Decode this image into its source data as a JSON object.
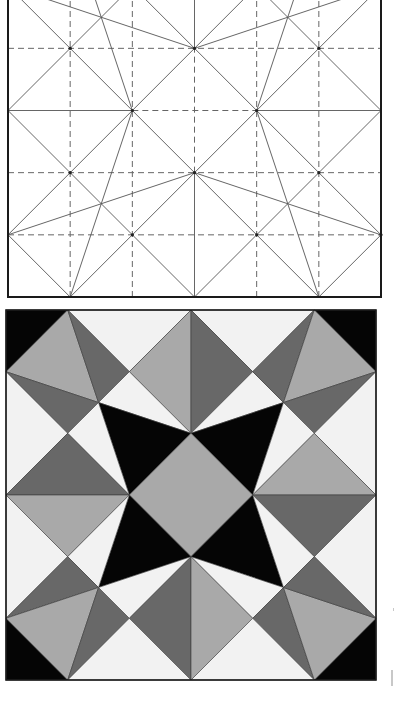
{
  "figure": {
    "grid_units": 6,
    "colors": {
      "paper": "#ffffff",
      "frame": "#1a1a1a",
      "crease_solid": "#555555",
      "crease_dashed": "#666666",
      "white": "#f2f2f2",
      "light_gray": "#a9a9a9",
      "dark_gray": "#686868",
      "black": "#050505"
    }
  },
  "crease_pattern": {
    "label": "crease pattern",
    "dashed_lines": [
      [
        1,
        0,
        1,
        6
      ],
      [
        2,
        0,
        2,
        6
      ],
      [
        4,
        0,
        4,
        6
      ],
      [
        5,
        0,
        5,
        6
      ],
      [
        3,
        2,
        3,
        4
      ],
      [
        0,
        1,
        6,
        1
      ],
      [
        0,
        2,
        6,
        2
      ],
      [
        0,
        4,
        6,
        4
      ],
      [
        0,
        5,
        6,
        5
      ],
      [
        2,
        3,
        4,
        3
      ]
    ],
    "solid_lines": [
      [
        3,
        0,
        3,
        2
      ],
      [
        3,
        4,
        3,
        6
      ],
      [
        0,
        3,
        2,
        3
      ],
      [
        4,
        3,
        6,
        3
      ],
      [
        0,
        1,
        1,
        0
      ],
      [
        1,
        0,
        2,
        1
      ],
      [
        2,
        1,
        3,
        0
      ],
      [
        3,
        0,
        4,
        1
      ],
      [
        4,
        1,
        5,
        0
      ],
      [
        5,
        0,
        6,
        1
      ],
      [
        0,
        1,
        1,
        2
      ],
      [
        1,
        2,
        2,
        1
      ],
      [
        2,
        1,
        3,
        2
      ],
      [
        3,
        2,
        4,
        1
      ],
      [
        4,
        1,
        5,
        2
      ],
      [
        5,
        2,
        6,
        1
      ],
      [
        0,
        3,
        1,
        2
      ],
      [
        1,
        2,
        2,
        3
      ],
      [
        2,
        3,
        3,
        2
      ],
      [
        3,
        2,
        4,
        3
      ],
      [
        4,
        3,
        5,
        2
      ],
      [
        5,
        2,
        6,
        3
      ],
      [
        0,
        3,
        1,
        4
      ],
      [
        1,
        4,
        2,
        3
      ],
      [
        2,
        3,
        3,
        4
      ],
      [
        3,
        4,
        4,
        3
      ],
      [
        4,
        3,
        5,
        4
      ],
      [
        5,
        4,
        6,
        3
      ],
      [
        0,
        5,
        1,
        4
      ],
      [
        1,
        4,
        2,
        5
      ],
      [
        2,
        5,
        3,
        4
      ],
      [
        3,
        4,
        4,
        5
      ],
      [
        4,
        5,
        5,
        4
      ],
      [
        5,
        4,
        6,
        5
      ],
      [
        0,
        5,
        1,
        6
      ],
      [
        1,
        6,
        2,
        5
      ],
      [
        2,
        5,
        3,
        6
      ],
      [
        3,
        6,
        4,
        5
      ],
      [
        4,
        5,
        5,
        6
      ],
      [
        5,
        6,
        6,
        5
      ],
      [
        0,
        1,
        3,
        2
      ],
      [
        3,
        2,
        6,
        1
      ],
      [
        0,
        5,
        3,
        4
      ],
      [
        3,
        4,
        6,
        5
      ],
      [
        1,
        0,
        2,
        3
      ],
      [
        5,
        0,
        4,
        3
      ],
      [
        1,
        6,
        2,
        3
      ],
      [
        5,
        6,
        4,
        3
      ]
    ]
  },
  "folded_pattern": {
    "label": "folded result",
    "polygons": [
      {
        "c": "black",
        "p": [
          [
            0,
            0
          ],
          [
            1,
            0
          ],
          [
            0,
            1
          ]
        ]
      },
      {
        "c": "black",
        "p": [
          [
            5,
            0
          ],
          [
            6,
            0
          ],
          [
            6,
            1
          ]
        ]
      },
      {
        "c": "black",
        "p": [
          [
            0,
            5
          ],
          [
            0,
            6
          ],
          [
            1,
            6
          ]
        ]
      },
      {
        "c": "black",
        "p": [
          [
            6,
            5
          ],
          [
            6,
            6
          ],
          [
            5,
            6
          ]
        ]
      },
      {
        "c": "white",
        "p": [
          [
            1,
            0
          ],
          [
            3,
            0
          ],
          [
            2,
            1
          ]
        ]
      },
      {
        "c": "white",
        "p": [
          [
            3,
            0
          ],
          [
            5,
            0
          ],
          [
            4,
            1
          ]
        ]
      },
      {
        "c": "light_gray",
        "p": [
          [
            1,
            0
          ],
          [
            0,
            1
          ],
          [
            1.5,
            1.5
          ]
        ]
      },
      {
        "c": "dark_gray",
        "p": [
          [
            1,
            0
          ],
          [
            2,
            1
          ],
          [
            1.5,
            1.5
          ]
        ]
      },
      {
        "c": "dark_gray",
        "p": [
          [
            0,
            1
          ],
          [
            1.5,
            1.5
          ],
          [
            1,
            2
          ]
        ]
      },
      {
        "c": "light_gray",
        "p": [
          [
            2,
            1
          ],
          [
            3,
            0
          ],
          [
            3,
            2
          ]
        ]
      },
      {
        "c": "dark_gray",
        "p": [
          [
            3,
            0
          ],
          [
            4,
            1
          ],
          [
            3,
            2
          ]
        ]
      },
      {
        "c": "white",
        "p": [
          [
            2,
            1
          ],
          [
            1.5,
            1.5
          ],
          [
            3,
            2
          ]
        ]
      },
      {
        "c": "white",
        "p": [
          [
            4,
            1
          ],
          [
            4.5,
            1.5
          ],
          [
            3,
            2
          ]
        ]
      },
      {
        "c": "dark_gray",
        "p": [
          [
            5,
            0
          ],
          [
            4,
            1
          ],
          [
            4.5,
            1.5
          ]
        ]
      },
      {
        "c": "light_gray",
        "p": [
          [
            5,
            0
          ],
          [
            6,
            1
          ],
          [
            4.5,
            1.5
          ]
        ]
      },
      {
        "c": "dark_gray",
        "p": [
          [
            6,
            1
          ],
          [
            4.5,
            1.5
          ],
          [
            5,
            2
          ]
        ]
      },
      {
        "c": "white",
        "p": [
          [
            0,
            1
          ],
          [
            1,
            2
          ],
          [
            0,
            3
          ]
        ]
      },
      {
        "c": "white",
        "p": [
          [
            6,
            1
          ],
          [
            5,
            2
          ],
          [
            6,
            3
          ]
        ]
      },
      {
        "c": "black",
        "p": [
          [
            1.5,
            1.5
          ],
          [
            3,
            2
          ],
          [
            2,
            3
          ]
        ]
      },
      {
        "c": "black",
        "p": [
          [
            3,
            2
          ],
          [
            4.5,
            1.5
          ],
          [
            4,
            3
          ]
        ]
      },
      {
        "c": "white",
        "p": [
          [
            1.5,
            1.5
          ],
          [
            1,
            2
          ],
          [
            2,
            3
          ]
        ]
      },
      {
        "c": "white",
        "p": [
          [
            4.5,
            1.5
          ],
          [
            5,
            2
          ],
          [
            4,
            3
          ]
        ]
      },
      {
        "c": "light_gray",
        "p": [
          [
            3,
            2
          ],
          [
            4,
            3
          ],
          [
            3,
            4
          ],
          [
            2,
            3
          ]
        ]
      },
      {
        "c": "dark_gray",
        "p": [
          [
            1,
            2
          ],
          [
            2,
            3
          ],
          [
            0,
            3
          ]
        ]
      },
      {
        "c": "light_gray",
        "p": [
          [
            0,
            3
          ],
          [
            2,
            3
          ],
          [
            1,
            4
          ]
        ]
      },
      {
        "c": "light_gray",
        "p": [
          [
            5,
            2
          ],
          [
            6,
            3
          ],
          [
            4,
            3
          ]
        ]
      },
      {
        "c": "dark_gray",
        "p": [
          [
            4,
            3
          ],
          [
            6,
            3
          ],
          [
            5,
            4
          ]
        ]
      },
      {
        "c": "black",
        "p": [
          [
            2,
            3
          ],
          [
            3,
            4
          ],
          [
            1.5,
            4.5
          ]
        ]
      },
      {
        "c": "black",
        "p": [
          [
            4,
            3
          ],
          [
            3,
            4
          ],
          [
            4.5,
            4.5
          ]
        ]
      },
      {
        "c": "white",
        "p": [
          [
            2,
            3
          ],
          [
            1.5,
            4.5
          ],
          [
            1,
            4
          ]
        ]
      },
      {
        "c": "white",
        "p": [
          [
            4,
            3
          ],
          [
            5,
            4
          ],
          [
            4.5,
            4.5
          ]
        ]
      },
      {
        "c": "white",
        "p": [
          [
            0,
            3
          ],
          [
            1,
            4
          ],
          [
            0,
            5
          ]
        ]
      },
      {
        "c": "white",
        "p": [
          [
            6,
            3
          ],
          [
            5,
            4
          ],
          [
            6,
            5
          ]
        ]
      },
      {
        "c": "dark_gray",
        "p": [
          [
            0,
            5
          ],
          [
            1,
            4
          ],
          [
            1.5,
            4.5
          ]
        ]
      },
      {
        "c": "light_gray",
        "p": [
          [
            0,
            5
          ],
          [
            1.5,
            4.5
          ],
          [
            1,
            6
          ]
        ]
      },
      {
        "c": "dark_gray",
        "p": [
          [
            1.5,
            4.5
          ],
          [
            2,
            5
          ],
          [
            1,
            6
          ]
        ]
      },
      {
        "c": "white",
        "p": [
          [
            1.5,
            4.5
          ],
          [
            3,
            4
          ],
          [
            2,
            5
          ]
        ]
      },
      {
        "c": "white",
        "p": [
          [
            4.5,
            4.5
          ],
          [
            3,
            4
          ],
          [
            4,
            5
          ]
        ]
      },
      {
        "c": "dark_gray",
        "p": [
          [
            2,
            5
          ],
          [
            3,
            4
          ],
          [
            3,
            6
          ]
        ]
      },
      {
        "c": "light_gray",
        "p": [
          [
            3,
            4
          ],
          [
            4,
            5
          ],
          [
            3,
            6
          ]
        ]
      },
      {
        "c": "dark_gray",
        "p": [
          [
            4,
            5
          ],
          [
            4.5,
            4.5
          ],
          [
            5,
            6
          ]
        ]
      },
      {
        "c": "light_gray",
        "p": [
          [
            4.5,
            4.5
          ],
          [
            6,
            5
          ],
          [
            5,
            6
          ]
        ]
      },
      {
        "c": "dark_gray",
        "p": [
          [
            5,
            4
          ],
          [
            4.5,
            4.5
          ],
          [
            6,
            5
          ]
        ]
      },
      {
        "c": "white",
        "p": [
          [
            1,
            6
          ],
          [
            2,
            5
          ],
          [
            3,
            6
          ]
        ]
      },
      {
        "c": "white",
        "p": [
          [
            3,
            6
          ],
          [
            4,
            5
          ],
          [
            5,
            6
          ]
        ]
      }
    ]
  }
}
